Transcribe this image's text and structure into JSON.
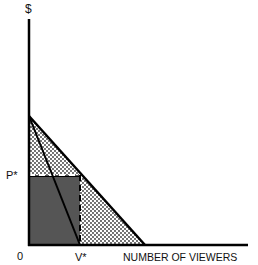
{
  "diagram": {
    "y_axis_label": "$",
    "x_axis_label": "NUMBER OF VIEWERS",
    "origin_label": "0",
    "price_label": "P*",
    "quantity_label": "V*",
    "colors": {
      "shaded_rect": "#555555",
      "hatch_fill": "#bbbbbb",
      "axis": "#000000",
      "background": "#ffffff"
    }
  }
}
